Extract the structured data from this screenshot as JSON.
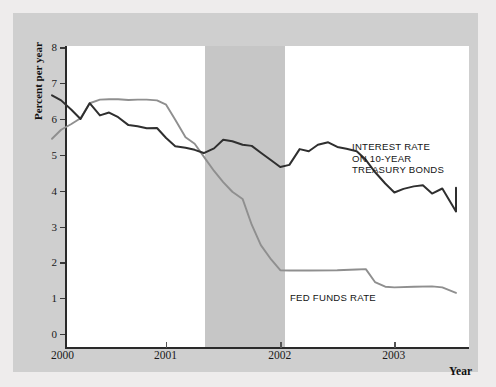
{
  "chart_data": {
    "type": "line",
    "title": "",
    "xlabel": "Year",
    "ylabel": "Percent per year",
    "xlim": [
      2000.0,
      2003.54
    ],
    "ylim": [
      0,
      8.4
    ],
    "y_ticks": [
      0,
      1,
      2,
      3,
      4,
      5,
      6,
      7,
      8
    ],
    "x_ticks": [
      2000,
      2001,
      2002,
      2003
    ],
    "x_tick_labels": [
      "2000",
      "2001",
      "2002",
      "2003"
    ],
    "grid": false,
    "legend_position": "inline-annotations",
    "annotations": [
      {
        "name": "treasury-label",
        "text_lines": [
          "INTEREST RATE",
          "ON 10-YEAR",
          "TREASURY BONDS"
        ]
      },
      {
        "name": "fedfunds-label",
        "text_lines": [
          "FED FUNDS RATE"
        ]
      }
    ],
    "shaded_region": {
      "name": "recession-band",
      "label": "Recession",
      "x_start": 2001.23,
      "x_end": 2001.93,
      "color": "#c6c6c6"
    },
    "series": [
      {
        "name": "INTEREST RATE ON 10-YEAR TREASURY BONDS",
        "color": "#2f2f2f",
        "x": [
          2000.0,
          2000.08,
          2000.17,
          2000.25,
          2000.33,
          2000.42,
          2000.5,
          2000.58,
          2000.67,
          2000.75,
          2000.83,
          2000.92,
          2001.0,
          2001.08,
          2001.17,
          2001.25,
          2001.33,
          2001.42,
          2001.5,
          2001.58,
          2001.67,
          2001.75,
          2001.83,
          2001.92,
          2002.0,
          2002.08,
          2002.17,
          2002.25,
          2002.33,
          2002.42,
          2002.5,
          2002.58,
          2002.67,
          2002.75,
          2002.83,
          2002.92,
          2003.0,
          2003.08,
          2003.17,
          2003.25,
          2003.33,
          2003.42,
          2003.54
        ],
        "values": [
          6.66,
          6.52,
          6.26,
          6.0,
          6.44,
          6.1,
          6.18,
          6.05,
          5.83,
          5.8,
          5.74,
          5.75,
          5.47,
          5.24,
          5.2,
          5.14,
          5.05,
          5.18,
          5.42,
          5.38,
          5.28,
          5.25,
          5.06,
          4.85,
          4.66,
          4.72,
          5.16,
          5.1,
          5.28,
          5.35,
          5.22,
          5.17,
          5.1,
          4.86,
          4.52,
          4.2,
          3.95,
          4.05,
          4.12,
          4.15,
          3.92,
          4.06,
          3.42
        ],
        "values_end": 4.08
      },
      {
        "name": "FED FUNDS RATE",
        "color": "#8f8f8f",
        "x": [
          2000.0,
          2000.08,
          2000.17,
          2000.25,
          2000.33,
          2000.42,
          2000.5,
          2000.58,
          2000.67,
          2000.75,
          2000.83,
          2000.92,
          2001.0,
          2001.08,
          2001.17,
          2001.25,
          2001.33,
          2001.42,
          2001.5,
          2001.58,
          2001.67,
          2001.75,
          2001.83,
          2001.92,
          2002.0,
          2002.08,
          2002.25,
          2002.5,
          2002.67,
          2002.75,
          2002.83,
          2002.92,
          2003.0,
          2003.17,
          2003.33,
          2003.42,
          2003.54
        ],
        "values": [
          5.45,
          5.7,
          5.86,
          6.02,
          6.44,
          6.54,
          6.55,
          6.55,
          6.53,
          6.54,
          6.54,
          6.52,
          6.4,
          5.98,
          5.49,
          5.31,
          4.95,
          4.55,
          4.24,
          3.97,
          3.77,
          3.05,
          2.48,
          2.08,
          1.78,
          1.77,
          1.77,
          1.78,
          1.8,
          1.81,
          1.45,
          1.32,
          1.3,
          1.32,
          1.33,
          1.3,
          1.15
        ]
      }
    ]
  },
  "axis": {
    "y_title": "Percent per year",
    "x_title": "Year"
  },
  "labels": {
    "treasury_line1": "INTEREST RATE",
    "treasury_line2": "ON 10-YEAR",
    "treasury_line3": "TREASURY BONDS",
    "fedfunds": "FED FUNDS RATE"
  },
  "colors": {
    "treasury_line": "#2f2f2f",
    "fedfunds_line": "#8f8f8f",
    "recession_band": "#c6c6c6",
    "card_bg": "#cfcfcf",
    "plot_bg": "#ffffff",
    "axis": "#2a2a2a"
  }
}
